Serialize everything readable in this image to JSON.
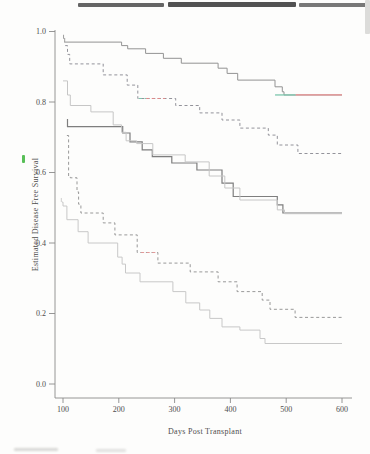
{
  "figure": {
    "x_axis_title": "Days Post Transplant",
    "y_axis_title": "Estimated Disease Free Survival"
  },
  "chart_data": {
    "type": "line",
    "subtype": "kaplan-meier-step-curves",
    "title": "",
    "xlabel": "Days Post Transplant",
    "ylabel": "Estimated Disease Free Survival",
    "xlim": [
      100,
      600
    ],
    "ylim": [
      0.0,
      1.0
    ],
    "xticks": [
      100,
      200,
      300,
      400,
      500,
      600
    ],
    "ytick_values": [
      0.0,
      0.2,
      0.4,
      0.6,
      0.8,
      1.0
    ],
    "ytick_labels": [
      "0.0",
      "0.2",
      "0.4",
      "0.6",
      "0.8",
      "1.0"
    ],
    "grid": false,
    "legend_position": "none",
    "axis_color": "#8a8a8a",
    "tick_text_color": "#4d4d4d",
    "series": [
      {
        "name": "group-1-solid-top",
        "style": "solid",
        "color": "#939393",
        "width": 1,
        "points": [
          [
            102,
            0.97
          ],
          [
            205,
            0.96
          ],
          [
            216,
            0.951
          ],
          [
            248,
            0.938
          ],
          [
            280,
            0.924
          ],
          [
            312,
            0.91
          ],
          [
            378,
            0.896
          ],
          [
            394,
            0.881
          ],
          [
            413,
            0.862
          ],
          [
            480,
            0.843
          ],
          [
            493,
            0.829
          ],
          [
            496,
            0.82
          ],
          [
            600,
            0.82
          ]
        ]
      },
      {
        "name": "group-2-dashed-upper",
        "style": "dashed",
        "color": "#87878f",
        "width": 0.9,
        "points": [
          [
            104,
            0.96
          ],
          [
            108,
            0.935
          ],
          [
            112,
            0.908
          ],
          [
            172,
            0.877
          ],
          [
            215,
            0.848
          ],
          [
            234,
            0.81
          ],
          [
            302,
            0.79
          ],
          [
            345,
            0.769
          ],
          [
            385,
            0.749
          ],
          [
            417,
            0.726
          ],
          [
            468,
            0.706
          ],
          [
            484,
            0.678
          ],
          [
            521,
            0.654
          ],
          [
            600,
            0.654
          ]
        ]
      },
      {
        "name": "group-3-solid-middle",
        "style": "solid",
        "color": "#7e7e7e",
        "width": 1.2,
        "points": [
          [
            107,
            0.75
          ],
          [
            108,
            0.73
          ],
          [
            207,
            0.712
          ],
          [
            220,
            0.687
          ],
          [
            242,
            0.664
          ],
          [
            260,
            0.645
          ],
          [
            295,
            0.627
          ],
          [
            340,
            0.607
          ],
          [
            385,
            0.57
          ],
          [
            405,
            0.532
          ],
          [
            484,
            0.508
          ],
          [
            494,
            0.485
          ],
          [
            600,
            0.485
          ]
        ]
      },
      {
        "name": "group-4-light-gray-middle",
        "style": "solid",
        "color": "#c6c6c6",
        "width": 1,
        "points": [
          [
            100,
            0.86
          ],
          [
            108,
            0.82
          ],
          [
            113,
            0.79
          ],
          [
            150,
            0.772
          ],
          [
            190,
            0.735
          ],
          [
            205,
            0.714
          ],
          [
            213,
            0.69
          ],
          [
            232,
            0.682
          ],
          [
            261,
            0.65
          ],
          [
            319,
            0.63
          ],
          [
            362,
            0.59
          ],
          [
            390,
            0.556
          ],
          [
            417,
            0.522
          ],
          [
            484,
            0.494
          ],
          [
            497,
            0.483
          ],
          [
            600,
            0.483
          ]
        ]
      },
      {
        "name": "group-5-dashed-lower",
        "style": "dashed",
        "color": "#8d8d8d",
        "width": 0.9,
        "points": [
          [
            107,
            0.705
          ],
          [
            110,
            0.59
          ],
          [
            113,
            0.585
          ],
          [
            125,
            0.545
          ],
          [
            128,
            0.51
          ],
          [
            132,
            0.485
          ],
          [
            172,
            0.457
          ],
          [
            193,
            0.423
          ],
          [
            233,
            0.373
          ],
          [
            270,
            0.343
          ],
          [
            328,
            0.318
          ],
          [
            378,
            0.29
          ],
          [
            412,
            0.262
          ],
          [
            457,
            0.238
          ],
          [
            471,
            0.212
          ],
          [
            516,
            0.189
          ],
          [
            600,
            0.189
          ]
        ]
      },
      {
        "name": "group-6-light-gray-bottom",
        "style": "solid",
        "color": "#c8c8c8",
        "width": 1,
        "points": [
          [
            98,
            0.516
          ],
          [
            100,
            0.505
          ],
          [
            107,
            0.466
          ],
          [
            127,
            0.432
          ],
          [
            145,
            0.4
          ],
          [
            198,
            0.36
          ],
          [
            206,
            0.34
          ],
          [
            212,
            0.315
          ],
          [
            238,
            0.29
          ],
          [
            297,
            0.262
          ],
          [
            320,
            0.23
          ],
          [
            345,
            0.21
          ],
          [
            363,
            0.186
          ],
          [
            385,
            0.162
          ],
          [
            417,
            0.153
          ],
          [
            453,
            0.129
          ],
          [
            462,
            0.115
          ],
          [
            600,
            0.115
          ]
        ]
      }
    ],
    "censor_ticks": [
      {
        "series": "group-1-solid-top",
        "points": [
          [
            101,
            0.985
          ],
          [
            103,
            0.976
          ]
        ]
      },
      {
        "series": "group-6-light-gray-bottom",
        "points": [
          [
            97,
            0.522
          ]
        ]
      }
    ],
    "color_print_artifacts": [
      {
        "name": "teal-tail-top-curve",
        "value": 0.82,
        "day_start": 480,
        "day_end": 517,
        "color": "#7cc6ad",
        "dashed": false,
        "width": 1.3
      },
      {
        "name": "red-tail-top-curve",
        "value": 0.82,
        "day_start": 517,
        "day_end": 600,
        "color": "#e98f8f",
        "dashed": false,
        "width": 1.3
      },
      {
        "name": "teal-dash-upper-dashed-curve",
        "value": 0.81,
        "day_start": 236,
        "day_end": 249,
        "color": "#7cc6ad",
        "dashed": true,
        "width": 1
      },
      {
        "name": "red-dash-upper-dashed-curve",
        "value": 0.81,
        "day_start": 249,
        "day_end": 283,
        "color": "#e08a8a",
        "dashed": true,
        "width": 1
      },
      {
        "name": "red-dash-lower-dashed-curve",
        "value": 0.373,
        "day_start": 240,
        "day_end": 270,
        "color": "#e59a9a",
        "dashed": true,
        "width": 1
      }
    ]
  },
  "scan_artifacts": {
    "top_edge_bars": [
      {
        "x": 78,
        "y": 3,
        "w": 86,
        "h": 4,
        "color": "#4a4a4a",
        "opacity": 0.85
      },
      {
        "x": 168,
        "y": 2,
        "w": 128,
        "h": 5,
        "color": "#3f3f3f",
        "opacity": 0.9
      },
      {
        "x": 299,
        "y": 3,
        "w": 71,
        "h": 4,
        "color": "#565656",
        "opacity": 0.8
      }
    ],
    "right_edge_streak": {
      "x": 365,
      "y": 0,
      "w": 5,
      "h": 34,
      "color": "#dcdcda",
      "opacity": 1
    },
    "green_mark": {
      "x": 22,
      "y": 155,
      "w": 3,
      "h": 8,
      "color": "#46b846",
      "opacity": 0.9
    },
    "bottom_smudges": [
      {
        "x": 14,
        "y": 448,
        "w": 44,
        "h": 3,
        "color": "#cfcfcd",
        "opacity": 0.8
      },
      {
        "x": 96,
        "y": 449,
        "w": 30,
        "h": 3,
        "color": "#d6d6d4",
        "opacity": 0.7
      }
    ]
  }
}
